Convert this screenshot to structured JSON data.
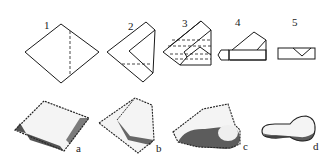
{
  "figure": {
    "fold_steps": [
      {
        "label": "1"
      },
      {
        "label": "2"
      },
      {
        "label": "3"
      },
      {
        "label": "4"
      },
      {
        "label": "5"
      }
    ],
    "results": [
      {
        "label": "a"
      },
      {
        "label": "b"
      },
      {
        "label": "c"
      },
      {
        "label": "d"
      }
    ],
    "colors": {
      "ink": "#1a1a1a",
      "background": "#ffffff"
    }
  }
}
